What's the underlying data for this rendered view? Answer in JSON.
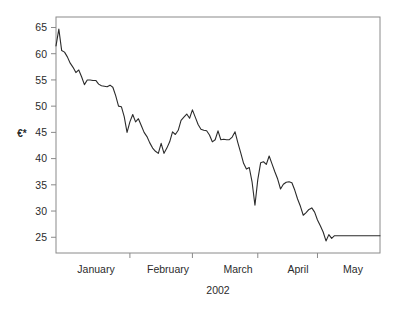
{
  "chart_data": {
    "type": "line",
    "title": "",
    "subtitle": "",
    "xlabel": "2002",
    "ylabel": "€*",
    "ylim": [
      22,
      67
    ],
    "yticks": [
      25,
      30,
      35,
      40,
      45,
      50,
      55,
      60,
      65
    ],
    "ytick_labels": [
      "25",
      "30",
      "35",
      "40",
      "45",
      "50",
      "55",
      "60",
      "65"
    ],
    "xtick_labels": [
      "January",
      "February",
      "March",
      "April",
      "May"
    ],
    "xtick_boundaries": [
      0,
      26,
      48,
      71,
      92,
      114
    ],
    "grid": false,
    "legend": null,
    "legend_position": "none",
    "axis_style": "box",
    "line_color": "#2b2b2b",
    "axis_color": "#8a8a8a",
    "background_color": "#ffffff",
    "x": [
      0,
      1,
      2,
      3,
      4,
      5,
      6,
      7,
      8,
      9,
      10,
      11,
      12,
      13,
      14,
      15,
      16,
      17,
      18,
      19,
      20,
      21,
      22,
      23,
      24,
      25,
      26,
      27,
      28,
      29,
      30,
      31,
      32,
      33,
      34,
      35,
      36,
      37,
      38,
      39,
      40,
      41,
      42,
      43,
      44,
      45,
      46,
      47,
      48,
      49,
      50,
      51,
      52,
      53,
      54,
      55,
      56,
      57,
      58,
      59,
      60,
      61,
      62,
      63,
      64,
      65,
      66,
      67,
      68,
      69,
      70,
      71,
      72,
      73,
      74,
      75,
      76,
      77,
      78,
      79,
      80,
      81,
      82,
      83,
      84,
      85,
      86,
      87,
      88,
      89,
      90,
      91,
      92,
      93,
      94,
      95,
      96,
      97,
      98,
      99,
      100,
      101,
      102,
      103,
      104,
      105,
      106,
      107,
      108,
      109,
      110,
      111,
      112,
      113,
      114
    ],
    "values": [
      61.5,
      64.7,
      60.6,
      60.3,
      59.4,
      58.2,
      57.4,
      56.4,
      56.9,
      55.6,
      54.1,
      55.0,
      55.0,
      54.9,
      54.9,
      54.2,
      53.9,
      53.8,
      53.7,
      54.0,
      53.6,
      52.0,
      50.0,
      49.9,
      48.0,
      45.0,
      47.0,
      48.4,
      47.0,
      47.6,
      46.3,
      45.0,
      44.2,
      43.0,
      42.0,
      41.4,
      41.0,
      42.9,
      41.0,
      42.0,
      43.2,
      45.1,
      44.6,
      45.4,
      47.3,
      47.9,
      48.5,
      47.7,
      49.3,
      47.9,
      46.5,
      45.6,
      45.4,
      45.3,
      44.5,
      43.2,
      43.6,
      45.3,
      43.6,
      43.7,
      43.6,
      43.6,
      44.1,
      45.1,
      43.0,
      41.1,
      39.1,
      38.0,
      38.3,
      35.5,
      31.1,
      36.0,
      39.2,
      39.4,
      38.9,
      40.5,
      39.0,
      37.5,
      36.1,
      34.2,
      35.1,
      35.5,
      35.6,
      35.4,
      34.0,
      32.3,
      30.9,
      29.2,
      29.7,
      30.3,
      30.6,
      29.8,
      28.3,
      27.2,
      26.0,
      24.3,
      25.5,
      24.8,
      25.3,
      25.3,
      25.3,
      25.3,
      25.3,
      25.3,
      25.3,
      25.3,
      25.3,
      25.3,
      25.3,
      25.3,
      25.3,
      25.3,
      25.3,
      25.3,
      25.3
    ]
  },
  "plot_geometry": {
    "left": 56,
    "right": 380,
    "top": 17,
    "bottom": 253
  },
  "xlabel_positions": [
    96,
    168,
    238,
    298,
    353
  ]
}
